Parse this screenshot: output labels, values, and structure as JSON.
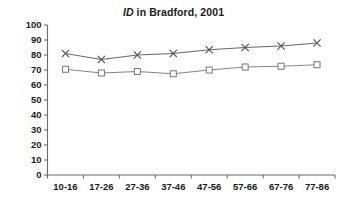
{
  "chart_data": {
    "type": "line",
    "title": "ID in Bradford, 2001",
    "title_italic_prefix": "ID",
    "title_rest": " in Bradford, 2001",
    "xlabel": "",
    "ylabel": "",
    "categories": [
      "10-16",
      "17-26",
      "27-36",
      "37-46",
      "47-56",
      "57-66",
      "67-76",
      "77-86"
    ],
    "ylim": [
      0,
      100
    ],
    "yticks": [
      0,
      10,
      20,
      30,
      40,
      50,
      60,
      70,
      80,
      90,
      100
    ],
    "grid": false,
    "legend": "none",
    "series": [
      {
        "name": "upper-series",
        "marker": "x",
        "color": "#555555",
        "values": [
          81,
          77,
          80,
          81,
          83.5,
          85,
          86,
          88
        ]
      },
      {
        "name": "lower-series",
        "marker": "square",
        "color": "#777777",
        "values": [
          70.5,
          68,
          69,
          67.5,
          70,
          72,
          72.5,
          73.5
        ]
      }
    ]
  },
  "colors": {
    "background": "#ffffff",
    "axis": "#6b6b6b",
    "text": "#1a1a1a",
    "upper_line": "#555555",
    "lower_line": "#888888"
  }
}
